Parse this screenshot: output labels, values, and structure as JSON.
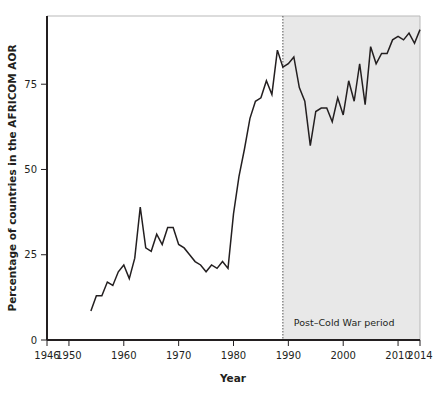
{
  "chart_data": {
    "type": "line",
    "title": "",
    "xlabel": "Year",
    "ylabel": "Percentage of countries in the AFRICOM AOR",
    "xlim": [
      1946,
      2014
    ],
    "ylim": [
      0,
      95
    ],
    "grid": false,
    "legend": null,
    "xticks": [
      1946,
      1950,
      1960,
      1970,
      1980,
      1990,
      2000,
      2010,
      2014
    ],
    "xtick_labels": [
      "1946",
      "1950",
      "1960",
      "1970",
      "1980",
      "1990",
      "2000",
      "2010",
      "2014"
    ],
    "yticks": [
      0,
      25,
      50,
      75
    ],
    "ytick_labels": [
      "0",
      "25",
      "50",
      "75"
    ],
    "line_color": "#231f20",
    "shaded_region": {
      "label": "Post–Cold War period",
      "start": 1989,
      "end": 2014,
      "fill_color": "#e8e8e8",
      "divider_color": "#555555"
    },
    "x": [
      1954,
      1955,
      1956,
      1957,
      1958,
      1959,
      1960,
      1961,
      1962,
      1963,
      1964,
      1965,
      1966,
      1967,
      1968,
      1969,
      1970,
      1971,
      1972,
      1973,
      1974,
      1975,
      1976,
      1977,
      1978,
      1979,
      1980,
      1981,
      1982,
      1983,
      1984,
      1985,
      1986,
      1987,
      1988,
      1989,
      1990,
      1991,
      1992,
      1993,
      1994,
      1995,
      1996,
      1997,
      1998,
      1999,
      2000,
      2001,
      2002,
      2003,
      2004,
      2005,
      2006,
      2007,
      2008,
      2009,
      2010,
      2011,
      2012,
      2013,
      2014
    ],
    "y": [
      8.5,
      13,
      13,
      17,
      16,
      20,
      22,
      18,
      24,
      39,
      27,
      26,
      31,
      28,
      33,
      33,
      28,
      27,
      25,
      23,
      22,
      20,
      22,
      21,
      23,
      21,
      37,
      48,
      56,
      65,
      70,
      71,
      76,
      72,
      85,
      80,
      81,
      83,
      74,
      70,
      57,
      67,
      68,
      68,
      64,
      71,
      66,
      76,
      70,
      81,
      69,
      86,
      81,
      84,
      84,
      88,
      89,
      88,
      90,
      87,
      91
    ],
    "series": [
      {
        "name": "Percentage of countries in the AFRICOM AOR",
        "values": [
          8.5,
          13,
          13,
          17,
          16,
          20,
          22,
          18,
          24,
          39,
          27,
          26,
          31,
          28,
          33,
          33,
          28,
          27,
          25,
          23,
          22,
          20,
          22,
          21,
          23,
          21,
          37,
          48,
          56,
          65,
          70,
          71,
          76,
          72,
          85,
          80,
          81,
          83,
          74,
          70,
          57,
          67,
          68,
          68,
          64,
          71,
          66,
          76,
          70,
          81,
          69,
          86,
          81,
          84,
          84,
          88,
          89,
          88,
          90,
          87,
          91
        ]
      }
    ]
  }
}
